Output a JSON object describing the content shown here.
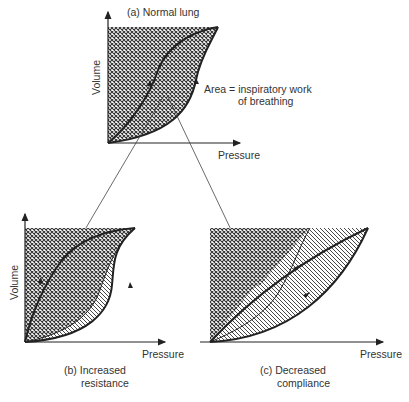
{
  "panels": {
    "a": {
      "title": "(a)  Normal lung",
      "ylabel": "Volume",
      "xlabel": "Pressure",
      "annotation_line1": "Area =  inspiratory work",
      "annotation_line2": "of breathing"
    },
    "b": {
      "ylabel": "Volume",
      "xlabel": "Pressure",
      "caption_line1": "(b)  Increased",
      "caption_line2": "resistance"
    },
    "c": {
      "xlabel": "Pressure",
      "caption_line1": "(c)  Decreased",
      "caption_line2": "compliance"
    }
  },
  "legend": {
    "crosshatch": "Area = inspiratory work of breathing",
    "diagonal_hatch": "additional area"
  },
  "colors": {
    "ink": "#222222",
    "background": "#ffffff"
  }
}
